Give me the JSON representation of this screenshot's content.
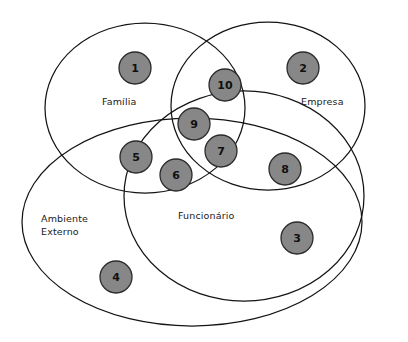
{
  "diagram": {
    "type": "venn",
    "width": 408,
    "height": 342,
    "background_color": "#ffffff",
    "outline_color": "#141414",
    "node_fill_color": "#878787",
    "node_stroke_color": "#2b2b2b",
    "text_color": "#1a1a1a",
    "sets": [
      {
        "id": "familia",
        "label": "Família",
        "shape": "circle",
        "cx": 145,
        "cy": 108,
        "rx": 100,
        "ry": 85,
        "rotation": 0,
        "label_x": 102,
        "label_y": 105
      },
      {
        "id": "empresa",
        "label": "Empresa",
        "shape": "circle",
        "cx": 268,
        "cy": 106,
        "rx": 97,
        "ry": 84,
        "rotation": 0,
        "label_x": 301,
        "label_y": 105
      },
      {
        "id": "ambiente-externo",
        "label": "Ambiente Externo",
        "label_line_1": "Ambiente",
        "label_line_2": "Externo",
        "shape": "ellipse",
        "cx": 192,
        "cy": 222,
        "rx": 170,
        "ry": 104,
        "rotation": 0,
        "label_x": 41,
        "label_y": 222
      },
      {
        "id": "funcionario",
        "label": "Funcionário",
        "shape": "ellipse",
        "cx": 244,
        "cy": 196,
        "rx": 120,
        "ry": 105,
        "rotation": 0,
        "label_x": 178,
        "label_y": 219
      }
    ],
    "nodes": [
      {
        "id": "n1",
        "label": "1",
        "cx": 135,
        "cy": 68,
        "r": 16,
        "region": "familia"
      },
      {
        "id": "n2",
        "label": "2",
        "cx": 303,
        "cy": 68,
        "r": 16,
        "region": "empresa"
      },
      {
        "id": "n3",
        "label": "3",
        "cx": 297,
        "cy": 238,
        "r": 16,
        "region": "funcionario-ambiente"
      },
      {
        "id": "n4",
        "label": "4",
        "cx": 116,
        "cy": 277,
        "r": 16,
        "region": "ambiente-externo"
      },
      {
        "id": "n5",
        "label": "5",
        "cx": 136,
        "cy": 157,
        "r": 16,
        "region": "familia-ambiente"
      },
      {
        "id": "n6",
        "label": "6",
        "cx": 176,
        "cy": 175,
        "r": 16,
        "region": "familia-ambiente-funcionario"
      },
      {
        "id": "n7",
        "label": "7",
        "cx": 221,
        "cy": 151,
        "r": 16,
        "region": "empresa-funcionario-ambiente"
      },
      {
        "id": "n8",
        "label": "8",
        "cx": 285,
        "cy": 169,
        "r": 16,
        "region": "empresa-ambiente"
      },
      {
        "id": "n9",
        "label": "9",
        "cx": 194,
        "cy": 124,
        "r": 16,
        "region": "familia-empresa-funcionario-ambiente"
      },
      {
        "id": "n10",
        "label": "10",
        "cx": 225,
        "cy": 85,
        "r": 16,
        "region": "familia-empresa"
      }
    ]
  }
}
